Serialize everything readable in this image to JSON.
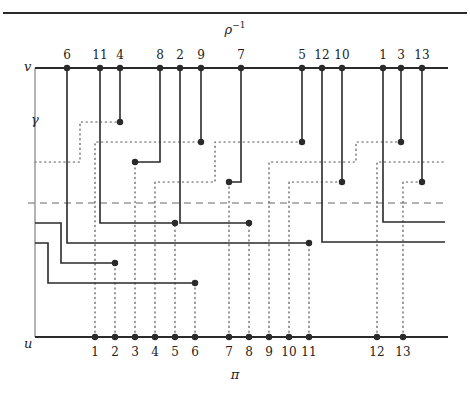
{
  "title": {
    "text": "ρ",
    "sup": "−1",
    "x": 235,
    "y": 34
  },
  "bottom_label": {
    "text": "π",
    "x": 235,
    "y": 379
  },
  "colors": {
    "ink": "#2a2a2a",
    "gray": "#8a8a8a",
    "dashed": "#9a9a9a"
  },
  "top_rule": {
    "x1": 3,
    "x2": 467,
    "y": 13
  },
  "v_line": {
    "label": "v",
    "x1": 35,
    "x2": 448,
    "y": 68,
    "label_x": 24,
    "label_y": 71
  },
  "u_line": {
    "label": "u",
    "x1": 35,
    "x2": 448,
    "y": 337,
    "label_x": 24,
    "label_y": 348
  },
  "gamma": {
    "label": "γ",
    "x": 35,
    "y1": 68,
    "y2": 337,
    "label_x": 31,
    "label_y": 124
  },
  "dashed_line": {
    "x1": 28,
    "x2": 448,
    "y": 203
  },
  "v_points": [
    {
      "label": "6",
      "x": 67
    },
    {
      "label": "11",
      "x": 100
    },
    {
      "label": "4",
      "x": 120
    },
    {
      "label": "8",
      "x": 160
    },
    {
      "label": "2",
      "x": 180
    },
    {
      "label": "9",
      "x": 201
    },
    {
      "label": "7",
      "x": 241
    },
    {
      "label": "5",
      "x": 302
    },
    {
      "label": "12",
      "x": 322
    },
    {
      "label": "10",
      "x": 342
    },
    {
      "label": "1",
      "x": 383
    },
    {
      "label": "3",
      "x": 401
    },
    {
      "label": "13",
      "x": 422
    }
  ],
  "u_points": [
    {
      "label": "1",
      "x": 95
    },
    {
      "label": "2",
      "x": 115
    },
    {
      "label": "3",
      "x": 135
    },
    {
      "label": "4",
      "x": 155
    },
    {
      "label": "5",
      "x": 175
    },
    {
      "label": "6",
      "x": 195
    },
    {
      "label": "7",
      "x": 229
    },
    {
      "label": "8",
      "x": 249
    },
    {
      "label": "9",
      "x": 269
    },
    {
      "label": "10",
      "x": 289
    },
    {
      "label": "11",
      "x": 309
    },
    {
      "label": "12",
      "x": 377
    },
    {
      "label": "13",
      "x": 403
    }
  ],
  "solid_paths": [
    {
      "id": "v4",
      "points": [
        [
          120,
          68
        ],
        [
          120,
          122
        ]
      ],
      "end_dot": true
    },
    {
      "id": "v9",
      "points": [
        [
          201,
          68
        ],
        [
          201,
          142
        ]
      ],
      "end_dot": true
    },
    {
      "id": "v8",
      "points": [
        [
          160,
          68
        ],
        [
          160,
          162
        ],
        [
          135,
          162
        ]
      ],
      "end_dot": true
    },
    {
      "id": "v7",
      "points": [
        [
          241,
          68
        ],
        [
          241,
          182
        ],
        [
          229,
          182
        ]
      ],
      "end_dot": true
    },
    {
      "id": "v5",
      "points": [
        [
          302,
          68
        ],
        [
          302,
          142
        ]
      ],
      "end_dot": true
    },
    {
      "id": "v10",
      "points": [
        [
          342,
          68
        ],
        [
          342,
          182
        ]
      ],
      "end_dot": true
    },
    {
      "id": "v3",
      "points": [
        [
          401,
          68
        ],
        [
          401,
          142
        ]
      ],
      "end_dot": true
    },
    {
      "id": "v13",
      "points": [
        [
          422,
          68
        ],
        [
          422,
          182
        ]
      ],
      "end_dot": true
    },
    {
      "id": "v11",
      "points": [
        [
          100,
          68
        ],
        [
          100,
          223
        ],
        [
          175,
          223
        ]
      ],
      "end_dot": true
    },
    {
      "id": "v2",
      "points": [
        [
          180,
          68
        ],
        [
          180,
          223
        ],
        [
          249,
          223
        ]
      ],
      "end_dot": true
    },
    {
      "id": "v6",
      "points": [
        [
          67,
          68
        ],
        [
          67,
          243
        ],
        [
          309,
          243
        ]
      ],
      "end_dot": true
    },
    {
      "id": "v12",
      "points": [
        [
          322,
          68
        ],
        [
          322,
          242
        ],
        [
          445,
          242
        ]
      ],
      "end_dot": false
    },
    {
      "id": "v1",
      "points": [
        [
          383,
          68
        ],
        [
          383,
          222
        ],
        [
          445,
          222
        ]
      ],
      "end_dot": false
    },
    {
      "id": "g1",
      "points": [
        [
          35,
          223
        ],
        [
          61,
          223
        ],
        [
          61,
          263
        ],
        [
          115,
          263
        ]
      ],
      "end_dot": true
    },
    {
      "id": "g2",
      "points": [
        [
          35,
          243
        ],
        [
          48,
          243
        ],
        [
          48,
          283
        ],
        [
          195,
          283
        ]
      ],
      "end_dot": true
    }
  ],
  "dotted_paths": [
    {
      "id": "gamma-top",
      "points": [
        [
          35,
          162
        ],
        [
          80,
          162
        ],
        [
          80,
          122
        ],
        [
          120,
          122
        ]
      ]
    },
    {
      "id": "u1",
      "points": [
        [
          95,
          337
        ],
        [
          95,
          142
        ],
        [
          201,
          142
        ]
      ]
    },
    {
      "id": "u2",
      "points": [
        [
          115,
          337
        ],
        [
          115,
          263
        ]
      ]
    },
    {
      "id": "u3",
      "points": [
        [
          135,
          337
        ],
        [
          135,
          162
        ]
      ]
    },
    {
      "id": "u4",
      "points": [
        [
          155,
          337
        ],
        [
          155,
          182
        ],
        [
          215,
          182
        ],
        [
          215,
          142
        ],
        [
          302,
          142
        ]
      ]
    },
    {
      "id": "u5",
      "points": [
        [
          175,
          337
        ],
        [
          175,
          223
        ]
      ]
    },
    {
      "id": "u6",
      "points": [
        [
          195,
          337
        ],
        [
          195,
          283
        ]
      ]
    },
    {
      "id": "u7",
      "points": [
        [
          229,
          337
        ],
        [
          229,
          182
        ]
      ]
    },
    {
      "id": "u8",
      "points": [
        [
          249,
          337
        ],
        [
          249,
          223
        ]
      ]
    },
    {
      "id": "u9",
      "points": [
        [
          269,
          337
        ],
        [
          269,
          162
        ],
        [
          356,
          162
        ],
        [
          356,
          142
        ],
        [
          401,
          142
        ]
      ]
    },
    {
      "id": "u10",
      "points": [
        [
          289,
          337
        ],
        [
          289,
          182
        ],
        [
          342,
          182
        ]
      ]
    },
    {
      "id": "u11",
      "points": [
        [
          309,
          337
        ],
        [
          309,
          243
        ]
      ]
    },
    {
      "id": "u12",
      "points": [
        [
          377,
          337
        ],
        [
          377,
          162
        ],
        [
          445,
          162
        ]
      ]
    },
    {
      "id": "u13",
      "points": [
        [
          403,
          337
        ],
        [
          403,
          182
        ],
        [
          422,
          182
        ]
      ]
    }
  ]
}
